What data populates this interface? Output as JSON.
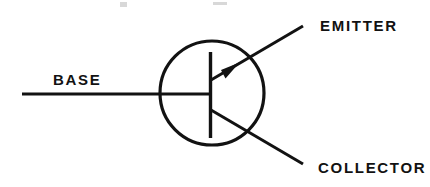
{
  "diagram": {
    "title": "NPN Bipolar Junction Transistor Schematic Symbol",
    "device_type": "npn-transistor",
    "background_color": "#ffffff",
    "ink_color": "#121212",
    "labels": {
      "base": "BASE",
      "emitter": "EMITTER",
      "collector": "COLLECTOR"
    },
    "geometry": {
      "envelope_circle": {
        "cx": 212,
        "cy": 93,
        "r": 52,
        "stroke_width": 3.2
      },
      "base_bar": {
        "x": 210.5,
        "y1": 52,
        "y2": 138,
        "stroke_width": 3.4
      },
      "base_lead": {
        "x1": 22,
        "y1": 94,
        "x2": 210,
        "y2": 94,
        "stroke_width": 3.0
      },
      "emitter_lead": {
        "x1": 211,
        "y1": 80,
        "x2": 303,
        "y2": 26,
        "stroke_width": 3.0
      },
      "collector_lead": {
        "x1": 211,
        "y1": 110,
        "x2": 303,
        "y2": 164,
        "stroke_width": 3.0
      },
      "emitter_arrow": {
        "tip_x": 238,
        "tip_y": 64,
        "direction": "outward-up-right",
        "filled": true
      }
    },
    "label_positions": {
      "base": {
        "x": 53,
        "y": 85
      },
      "emitter": {
        "x": 320,
        "y": 31
      },
      "collector": {
        "x": 318,
        "y": 173
      }
    },
    "scan_artifacts": [
      {
        "x": 120,
        "y": 2,
        "w": 7,
        "h": 5
      },
      {
        "x": 213,
        "y": 2,
        "w": 14,
        "h": 3
      }
    ]
  }
}
